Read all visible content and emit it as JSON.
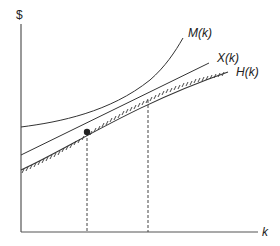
{
  "diagram": {
    "axes": {
      "y_label": "$",
      "x_label": "k"
    },
    "curves": [
      {
        "id": "M",
        "label": "M(k)",
        "style": "solid"
      },
      {
        "id": "X",
        "label": "X(k)",
        "style": "solid"
      },
      {
        "id": "H",
        "label": "H(k)",
        "style": "hatched"
      }
    ],
    "markers": [
      {
        "type": "dot",
        "description": "intersection of M(k), X(k) and H(k)"
      }
    ],
    "guides": [
      {
        "type": "dashed-vertical",
        "at": "first intersection point"
      },
      {
        "type": "dashed-vertical",
        "at": "second intersection of M(k) with X(k)/H(k)"
      }
    ],
    "colors": {
      "line": "#333333",
      "background": "#ffffff"
    }
  }
}
